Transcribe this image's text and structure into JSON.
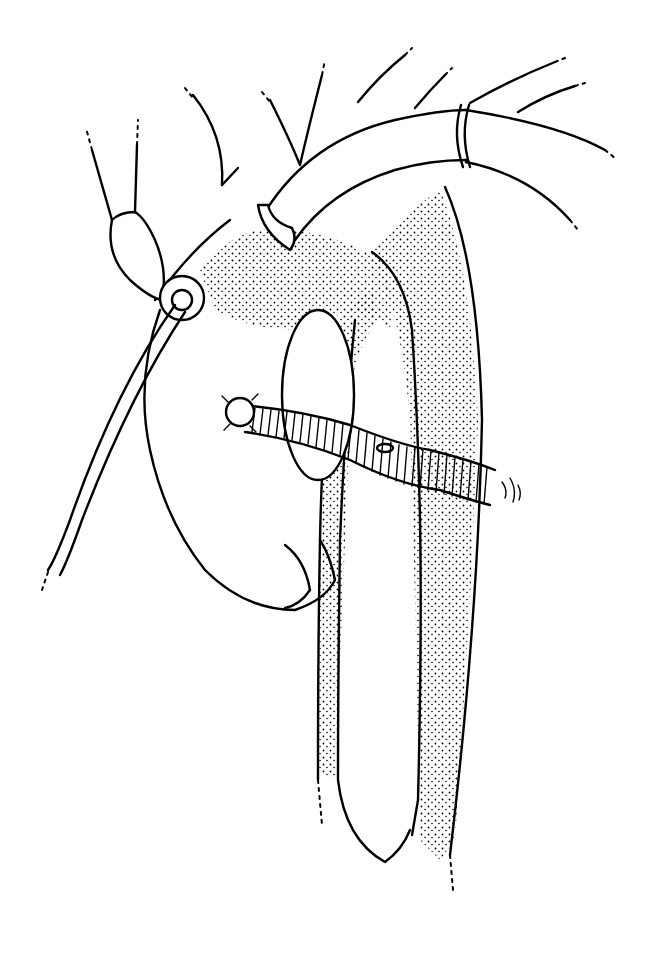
{
  "figure": {
    "type": "surgical-line-illustration",
    "colors": {
      "ink": "#000000",
      "background": "#ffffff"
    },
    "elements": [
      "aortic-arch-graft",
      "ligature-band",
      "heart",
      "right-atrial-appendage-cannula",
      "descending-aorta",
      "ribbed-vascular-graft",
      "great-vessel-branches"
    ]
  }
}
